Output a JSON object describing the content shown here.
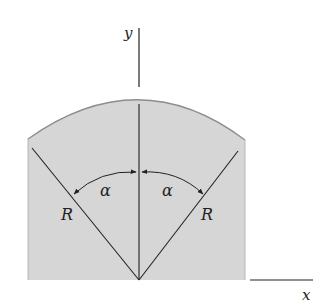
{
  "diagram": {
    "axes": {
      "x_label": "x",
      "y_label": "y"
    },
    "labels": {
      "angle_left": "α",
      "angle_right": "α",
      "radius_left": "R",
      "radius_right": "R"
    },
    "colors": {
      "fill": "#d6d6d6",
      "outline": "#8c8c8c",
      "line": "#2a2a2a",
      "background": "#ffffff"
    }
  }
}
